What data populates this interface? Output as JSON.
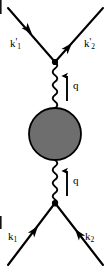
{
  "figure": {
    "type": "feynman-diagram",
    "width": 107,
    "height": 273,
    "background_color": "#ffffff",
    "line_color": "#000000",
    "blob_fill_color": "#6e6e6e",
    "blob_stroke_color": "#000000"
  },
  "labels": {
    "outgoing_left": {
      "base": "k",
      "prime": "'",
      "sub": "1",
      "text": "k'1"
    },
    "outgoing_right": {
      "base": "k",
      "prime": "'",
      "sub": "2",
      "text": "k'2"
    },
    "incoming_left": {
      "base": "k",
      "prime": "",
      "sub": "1",
      "text": "k1"
    },
    "incoming_right": {
      "base": "k",
      "prime": "",
      "sub": "2",
      "text": "k2"
    },
    "momentum_transfer_upper": "q",
    "momentum_transfer_lower": "q"
  },
  "geometry": {
    "vertex_top": {
      "x": 55,
      "y": 62
    },
    "vertex_bottom": {
      "x": 55,
      "y": 203
    },
    "blob": {
      "cx": 55,
      "cy": 134,
      "r": 26
    },
    "photon_upper": {
      "x": 55,
      "y_start": 62,
      "y_end": 108
    },
    "photon_lower": {
      "x": 55,
      "y_start": 160,
      "y_end": 203
    },
    "q_arrow_upper": {
      "x": 67,
      "y_tail": 101,
      "y_head": 74
    },
    "q_arrow_lower": {
      "x": 67,
      "y_tail": 196,
      "y_head": 169
    },
    "fermion_top_left": {
      "x1": 55,
      "y1": 62,
      "x2": 8,
      "y2": 8
    },
    "fermion_top_right": {
      "x1": 55,
      "y1": 62,
      "x2": 103,
      "y2": 8
    },
    "fermion_bottom_left": {
      "x1": 8,
      "y1": 265,
      "x2": 55,
      "y2": 203
    },
    "fermion_bottom_right": {
      "x1": 55,
      "y1": 203,
      "x2": 103,
      "y2": 265
    }
  }
}
